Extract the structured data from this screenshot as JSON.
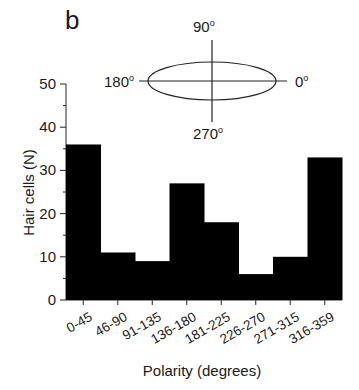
{
  "panel_label": "b",
  "orientation_diagram": {
    "top": "90",
    "right": "0",
    "bottom": "270",
    "left": "180",
    "degree_symbol": "o"
  },
  "chart_data": {
    "type": "bar",
    "title": "",
    "xlabel": "Polarity (degrees)",
    "ylabel": "Hair cells (N)",
    "categories": [
      "0-45",
      "46-90",
      "91-135",
      "136-180",
      "181-225",
      "226-270",
      "271-315",
      "316-359"
    ],
    "values": [
      36,
      11,
      9,
      27,
      18,
      6,
      10,
      33
    ],
    "ylim": [
      0,
      50
    ],
    "yticks": [
      0,
      10,
      20,
      30,
      40,
      50
    ],
    "yminor_ticks": [
      5,
      15,
      25,
      35,
      45
    ],
    "bar_color": "#000000",
    "bar_gap": 0,
    "grid": false,
    "legend": null
  }
}
